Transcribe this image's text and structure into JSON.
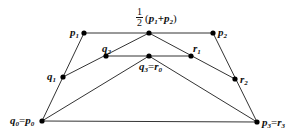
{
  "diagram": {
    "type": "de-casteljau-subdivision",
    "line_color": "#333333",
    "point_color": "#000000",
    "points": [
      {
        "id": "p0",
        "x": 42,
        "y": 121,
        "label_main": "q",
        "label_sub": "0",
        "label_eq": "=",
        "label_main2": "p",
        "label_sub2": "0"
      },
      {
        "id": "p1",
        "x": 84,
        "y": 33,
        "label_main": "p",
        "label_sub": "1"
      },
      {
        "id": "p2",
        "x": 213,
        "y": 33,
        "label_main": "p",
        "label_sub": "2"
      },
      {
        "id": "p3",
        "x": 257,
        "y": 122,
        "label_main": "p",
        "label_sub": "3",
        "label_eq": "=",
        "label_main2": "r",
        "label_sub2": "3"
      },
      {
        "id": "mid",
        "x": 149,
        "y": 33,
        "label_frac_num": "1",
        "label_frac_den": "2",
        "label_expr_open": "(",
        "label_a": "p",
        "label_a_sub": "1",
        "label_plus": "+",
        "label_b": "p",
        "label_b_sub": "2",
        "label_expr_close": ")"
      },
      {
        "id": "q1",
        "x": 63,
        "y": 77,
        "label_main": "q",
        "label_sub": "1"
      },
      {
        "id": "q2",
        "x": 106,
        "y": 56,
        "label_main": "q",
        "label_sub": "2"
      },
      {
        "id": "q3",
        "x": 149,
        "y": 56,
        "label_main": "q",
        "label_sub": "3",
        "label_eq": "=",
        "label_main2": "r",
        "label_sub2": "0"
      },
      {
        "id": "r1",
        "x": 191,
        "y": 56,
        "label_main": "r",
        "label_sub": "1"
      },
      {
        "id": "r2",
        "x": 235,
        "y": 79,
        "label_main": "r",
        "label_sub": "2"
      }
    ],
    "edges": [
      [
        "p0",
        "p1"
      ],
      [
        "p1",
        "p2"
      ],
      [
        "p2",
        "p3"
      ],
      [
        "p0",
        "p3"
      ],
      [
        "q1",
        "mid"
      ],
      [
        "mid",
        "r2"
      ],
      [
        "q2",
        "r1"
      ],
      [
        "p0",
        "q3"
      ],
      [
        "q3",
        "p3"
      ]
    ]
  }
}
